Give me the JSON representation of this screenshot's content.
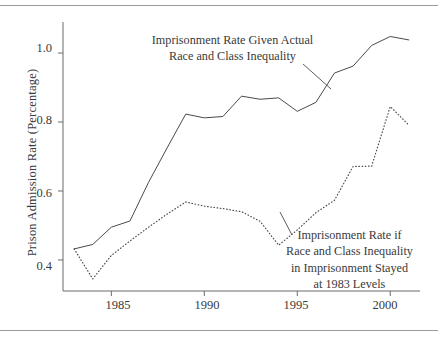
{
  "chart_data": {
    "type": "line",
    "title": "",
    "xlabel": "",
    "ylabel": "Prison Admission Rate (Percentage)",
    "xlim": [
      1982.4,
      2001.6
    ],
    "ylim": [
      0.31,
      1.09
    ],
    "grid": false,
    "legend_position": "inline-annotation",
    "xticks": [
      1985,
      1990,
      1995,
      2000
    ],
    "xtick_labels": [
      "1985",
      "1990",
      "1995",
      "2000"
    ],
    "yticks": [
      0.4,
      0.6,
      0.8,
      1.0
    ],
    "ytick_labels": [
      "0.4",
      "0.6",
      "0.8",
      "1.0"
    ],
    "x": [
      1983,
      1984,
      1985,
      1986,
      1987,
      1988,
      1989,
      1990,
      1991,
      1992,
      1993,
      1994,
      1995,
      1996,
      1997,
      1998,
      1999,
      2000,
      2001
    ],
    "series": [
      {
        "name": "Imprisonment Rate Given Actual Race and Class Inequality",
        "style": "solid",
        "color": "#4a4a4a",
        "values": [
          0.432,
          0.445,
          0.495,
          0.513,
          0.625,
          0.725,
          0.823,
          0.812,
          0.816,
          0.875,
          0.866,
          0.87,
          0.831,
          0.857,
          0.942,
          0.962,
          1.022,
          1.048,
          1.038
        ]
      },
      {
        "name": "Imprisonment Rate if Race and Class Inequality in Imprisonment Stayed at 1983 Levels",
        "style": "dotted",
        "color": "#4a4a4a",
        "values": [
          0.432,
          0.345,
          0.413,
          0.455,
          0.495,
          0.533,
          0.568,
          0.556,
          0.549,
          0.54,
          0.512,
          0.443,
          0.487,
          0.537,
          0.573,
          0.671,
          0.672,
          0.845,
          0.791
        ]
      }
    ],
    "annotations": [
      {
        "name": "actual-series-annotation",
        "lines": [
          "Imprisonment Rate Given Actual",
          "Race and Class Inequality"
        ],
        "leader_from": [
          303,
          64
        ],
        "leader_to": [
          331,
          89
        ]
      },
      {
        "name": "counterfactual-series-annotation",
        "lines": [
          "Imprisonment Rate if",
          "Race and Class Inequality",
          "in Imprisonment Stayed",
          "at 1983 Levels"
        ],
        "leader_from": [
          280,
          212
        ],
        "leader_to": [
          292,
          235
        ]
      }
    ]
  },
  "axes": {
    "y_axis_title": "Prison Admission Rate (Percentage)"
  }
}
